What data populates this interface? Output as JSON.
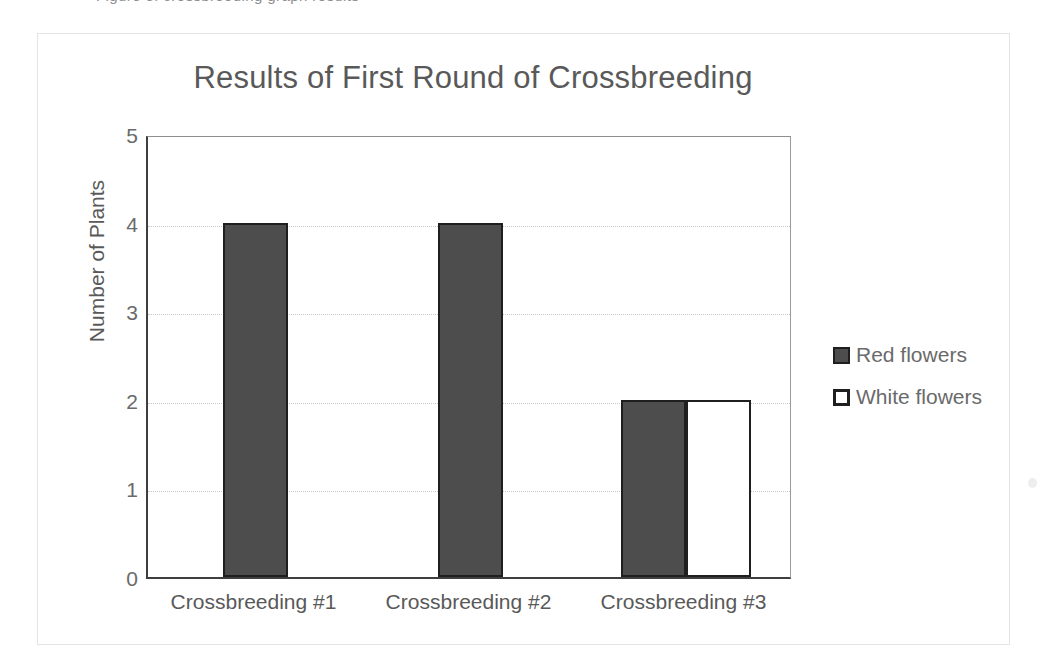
{
  "scan": {
    "top_ghost_text": "glyph descenders",
    "speckle_icon": "dust-speck"
  },
  "chart_data": {
    "type": "bar",
    "title": "Results of First Round of Crossbreeding",
    "xlabel": "",
    "ylabel": "Number of Plants",
    "categories": [
      "Crossbreeding #1",
      "Crossbreeding #2",
      "Crossbreeding #3"
    ],
    "series": [
      {
        "name": "Red flowers",
        "values": [
          4,
          4,
          2
        ],
        "color": "#4d4d4d"
      },
      {
        "name": "White flowers",
        "values": [
          null,
          null,
          2
        ],
        "color": "#ffffff"
      }
    ],
    "ylim": [
      0,
      5
    ],
    "yticks": [
      "0",
      "1",
      "2",
      "3",
      "4",
      "5"
    ],
    "grid": true,
    "legend_position": "right"
  },
  "legend": {
    "items": [
      {
        "label": "Red flowers",
        "swatch": "filled-square-swatch"
      },
      {
        "label": "White flowers",
        "swatch": "outlined-square-swatch"
      }
    ]
  },
  "colors": {
    "bar_fill_red": "#4d4d4d",
    "bar_fill_white": "#ffffff",
    "bar_border": "#1f1f1f",
    "axis": "#3f3f3f",
    "gridline": "#c8c8c8",
    "title_text": "#595959",
    "tick_text": "#6a6a6a",
    "frame": "#e4e4e6"
  }
}
